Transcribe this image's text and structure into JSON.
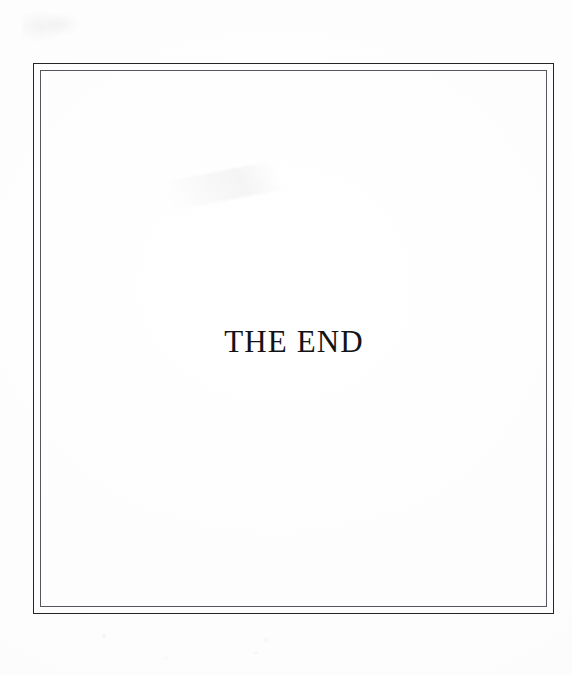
{
  "page": {
    "kind": "scanned-book-page",
    "background_color": "#fdfdfd",
    "width": 572,
    "height": 675
  },
  "frame": {
    "name": "double-rule-border",
    "outer_rule_color": "#252528",
    "inner_rule_color": "#56565c",
    "outer_rule_width_px": 1,
    "inner_rule_width_px": 1,
    "gap_px": 6
  },
  "content": {
    "end_text": "THE END",
    "text_color": "#131316",
    "alignment": "center"
  },
  "artifacts": {
    "smudge_top_left": "faint scanner smudge",
    "streak_diagonal": "faint diagonal scan streak",
    "specks_bottom": "faint paper specks in lower margin"
  }
}
